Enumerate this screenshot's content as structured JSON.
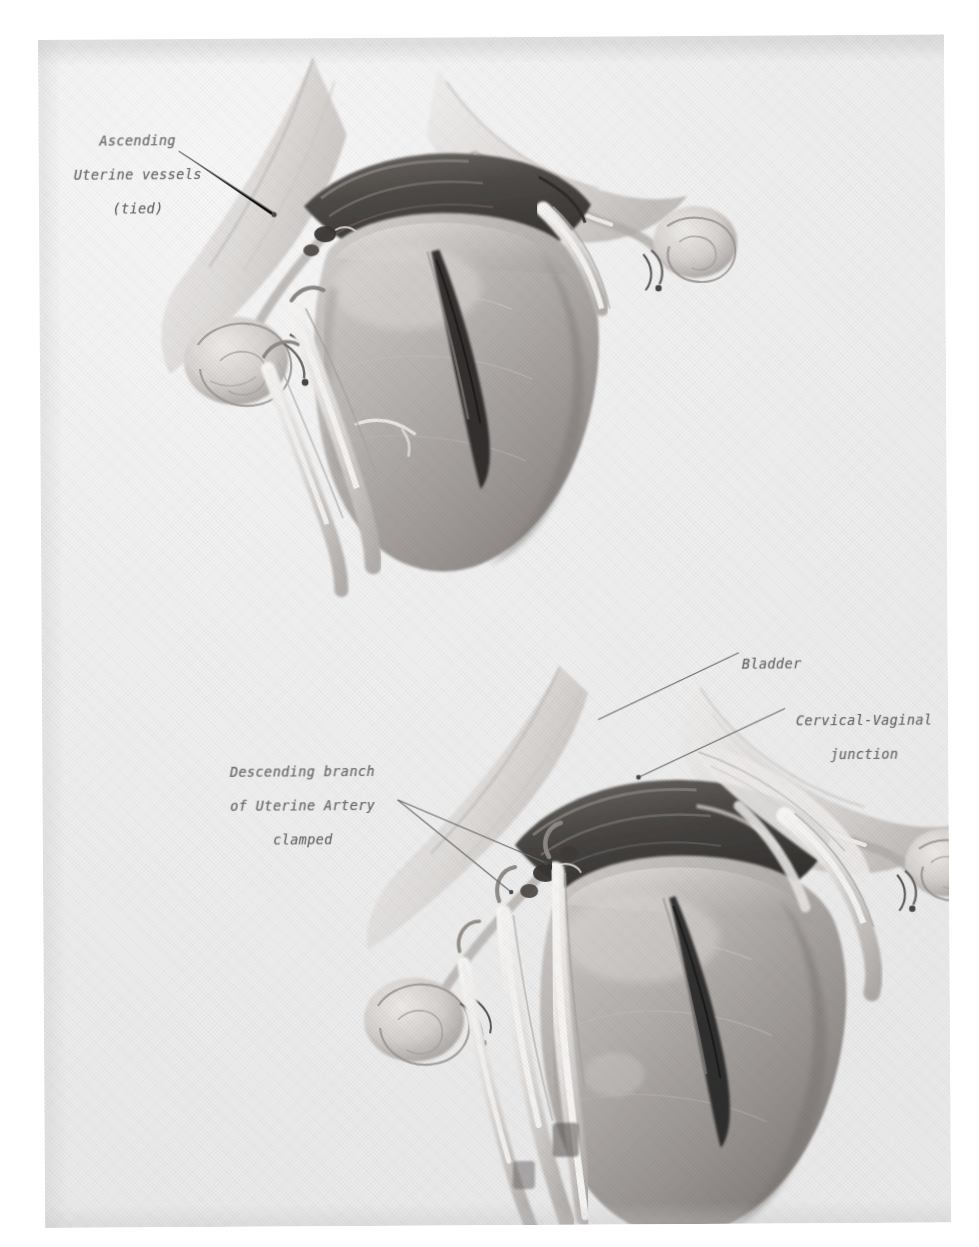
{
  "plate": {
    "title": "Abdominal hysterectomy — uterine vessel control",
    "background_color": "#f0f0f0",
    "ink_color": "#6a6a6a",
    "figure_count": 2
  },
  "figures": [
    {
      "id": "upper",
      "name": "uterus-with-ascending-uterine-vessels-tied",
      "labels": [
        {
          "name": "ascending-uterine-vessels-tied",
          "text": "Ascending\nUterine vessels\n(tied)",
          "align": "center",
          "x": 72,
          "y": 118
        }
      ]
    },
    {
      "id": "lower",
      "name": "uterus-with-descending-uterine-artery-clamped",
      "labels": [
        {
          "name": "bladder",
          "text": "Bladder",
          "align": "left",
          "x": 737,
          "y": 643
        },
        {
          "name": "cervical-vaginal-junction",
          "text": "Cervical-Vaginal\njunction",
          "align": "center",
          "x": 780,
          "y": 700
        },
        {
          "name": "descending-branch-of-uterine-artery-clamped",
          "text": "Descending branch\nof Uterine Artery\nclamped",
          "align": "right",
          "x": 222,
          "y": 748
        }
      ]
    }
  ],
  "label_text": {
    "ascending_line1": "Ascending",
    "ascending_line2": "Uterine vessels",
    "ascending_line3": "(tied)",
    "bladder": "Bladder",
    "cvj_line1": "Cervical-Vaginal",
    "cvj_line2": "junction",
    "descending_line1": "Descending branch",
    "descending_line2": "of Uterine Artery",
    "descending_line3": "clamped"
  }
}
